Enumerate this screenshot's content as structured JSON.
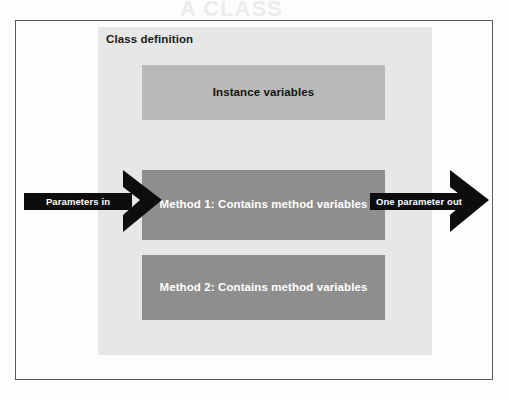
{
  "figure": {
    "panel_title": "Class definition",
    "boxes": [
      {
        "id": "instance-variables",
        "label": "Instance variables",
        "fill": "#b9b9b9",
        "text_color": "#141414"
      },
      {
        "id": "method-1",
        "label": "Method 1: Contains method variables",
        "fill": "#8e8e8e",
        "text_color": "#ffffff"
      },
      {
        "id": "method-2",
        "label": "Method 2: Contains method variables",
        "fill": "#8e8e8e",
        "text_color": "#ffffff"
      }
    ],
    "arrows": [
      {
        "id": "parameters-in",
        "label": "Parameters in",
        "direction": "right",
        "color": "#0d0d0d"
      },
      {
        "id": "one-parameter-out",
        "label": "One parameter out",
        "direction": "right",
        "color": "#0d0d0d"
      }
    ],
    "colors": {
      "frame_border": "#5b5b5f",
      "panel_background": "#e7e7e7",
      "page_background": "#fdfdfd",
      "arrow_fill": "#0d0d0d"
    }
  },
  "page_bleed": {
    "top_text": "A CLASS",
    "middle_text": "OO"
  }
}
